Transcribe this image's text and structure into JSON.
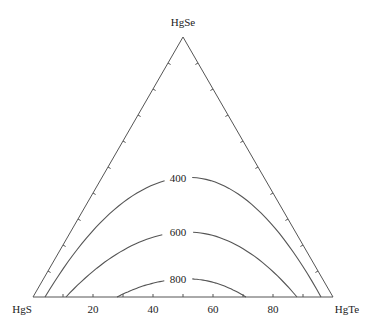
{
  "chart_data": {
    "type": "ternary-contour",
    "title": "",
    "vertices": {
      "top": "HgSe",
      "left": "HgS",
      "right": "HgTe"
    },
    "base_axis": {
      "ticks": [
        0,
        10,
        20,
        30,
        40,
        50,
        60,
        70,
        80,
        90,
        100
      ],
      "tick_labels": [
        "20",
        "40",
        "60",
        "80"
      ],
      "tick_label_values": [
        20,
        40,
        60,
        80
      ]
    },
    "side_ticks_every": 10,
    "contours": [
      {
        "level": 400,
        "label": "400",
        "base_start_pct": 4,
        "base_end_pct": 96,
        "peak_height_pct": 46
      },
      {
        "level": 600,
        "label": "600",
        "base_start_pct": 11,
        "base_end_pct": 88,
        "peak_height_pct": 25
      },
      {
        "level": 800,
        "label": "800",
        "base_start_pct": 28,
        "base_end_pct": 71,
        "peak_height_pct": 7
      }
    ],
    "colors": {
      "lines": "#555555",
      "text": "#222222"
    }
  }
}
